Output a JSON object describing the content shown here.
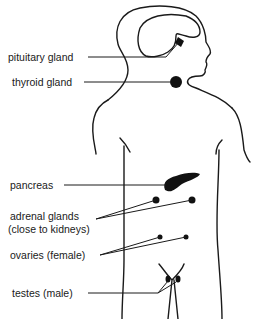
{
  "diagram": {
    "colors": {
      "ink": "#1a1a1a",
      "background": "#ffffff"
    },
    "labels": {
      "pituitary": "pituitary gland",
      "thyroid": "thyroid gland",
      "pancreas": "pancreas",
      "adrenal_line1": "adrenal glands",
      "adrenal_line2": "(close to kidneys)",
      "ovaries": "ovaries (female)",
      "testes": "testes (male)"
    }
  }
}
